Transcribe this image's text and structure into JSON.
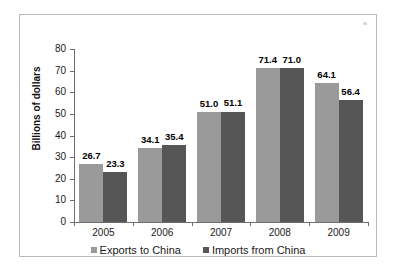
{
  "chart_data": {
    "type": "bar",
    "title": "",
    "xlabel": "",
    "ylabel": "Billions of dollars",
    "ylim": [
      0,
      80
    ],
    "ytick_labels": [
      "80",
      "70",
      "60",
      "50",
      "40",
      "30",
      "20",
      "10",
      "0"
    ],
    "ytick_values": [
      80,
      70,
      60,
      50,
      40,
      30,
      20,
      10,
      0
    ],
    "grid": false,
    "legend_position": "bottom",
    "categories": [
      "2005",
      "2006",
      "2007",
      "2008",
      "2009"
    ],
    "series": [
      {
        "name": "Exports to China",
        "color": "#9a9a9a",
        "values": [
          26.7,
          34.1,
          51.0,
          71.4,
          64.1
        ],
        "labels": [
          "26.7",
          "34.1",
          "51.0",
          "71.4",
          "64.1"
        ]
      },
      {
        "name": "Imports from China",
        "color": "#565656",
        "values": [
          23.3,
          35.4,
          51.1,
          71.0,
          56.4
        ],
        "labels": [
          "23.3",
          "35.4",
          "51.1",
          "71.0",
          "56.4"
        ]
      }
    ]
  },
  "legend": {
    "items": [
      {
        "label": "Exports to China"
      },
      {
        "label": "Imports from China"
      }
    ]
  }
}
